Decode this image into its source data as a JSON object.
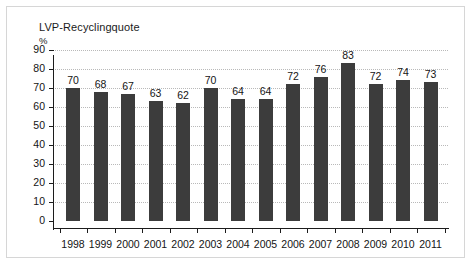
{
  "chart_data": {
    "type": "bar",
    "title": "LVP-Recyclingquote",
    "ylabel": "%",
    "xlabel": "",
    "categories": [
      "1998",
      "1999",
      "2000",
      "2001",
      "2002",
      "2003",
      "2004",
      "2005",
      "2006",
      "2007",
      "2008",
      "2009",
      "2010",
      "2011"
    ],
    "values": [
      70,
      68,
      67,
      63,
      62,
      70,
      64,
      64,
      72,
      76,
      83,
      72,
      74,
      73
    ],
    "value_labels": [
      "70",
      "68",
      "67",
      "63",
      "62",
      "70",
      "64",
      "64",
      "72",
      "76",
      "83",
      "72",
      "74",
      "73"
    ],
    "ylim": [
      0,
      90
    ],
    "ytick_labels": [
      "90",
      "80",
      "70",
      "60",
      "50",
      "40",
      "30",
      "20",
      "10",
      "0"
    ],
    "ytick_values": [
      90,
      80,
      70,
      60,
      50,
      40,
      30,
      20,
      10,
      0
    ],
    "grid": true,
    "grid_axis": "y",
    "legend": false,
    "bar_color": "#3c3c3c",
    "grid_color": "#b9b9b9",
    "axis_color": "#1c1c1c",
    "text_color": "#141414",
    "background_color": "#ffffff",
    "frame_color": "#d6d6d6"
  }
}
